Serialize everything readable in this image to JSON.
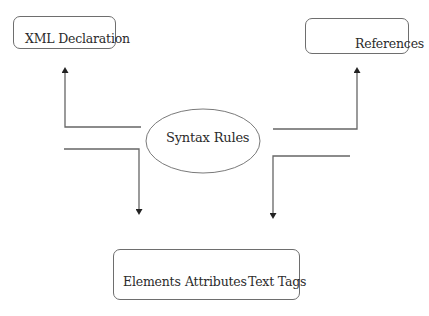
{
  "diagram": {
    "center": {
      "label": "Syntax Rules",
      "shape": "ellipse"
    },
    "nodes": [
      {
        "id": "xml-declaration",
        "label": "XML Declaration",
        "shape": "rounded-rectangle",
        "position": "top-left"
      },
      {
        "id": "references",
        "label": "References",
        "shape": "rounded-rectangle",
        "position": "top-right"
      },
      {
        "id": "components",
        "label": "Elements  Attributes  Text Tags",
        "shape": "rounded-rectangle",
        "position": "bottom",
        "items": [
          "Elements",
          "Attributes",
          "Text Tags"
        ]
      }
    ],
    "edges": [
      {
        "from": "Syntax Rules",
        "to": "XML Declaration",
        "direction": "up",
        "style": "elbow-arrow"
      },
      {
        "from": "Syntax Rules",
        "to": "References",
        "direction": "up",
        "style": "elbow-arrow"
      },
      {
        "from": "Syntax Rules",
        "to": "Elements Attributes Text Tags",
        "direction": "down",
        "style": "elbow-arrow",
        "side": "left"
      },
      {
        "from": "Syntax Rules",
        "to": "Elements Attributes Text Tags",
        "direction": "down",
        "style": "elbow-arrow",
        "side": "right"
      }
    ],
    "colors": {
      "line": "#555555",
      "box_border": "#6e6e6e",
      "text": "#2b2b2b",
      "background": "#ffffff"
    }
  }
}
